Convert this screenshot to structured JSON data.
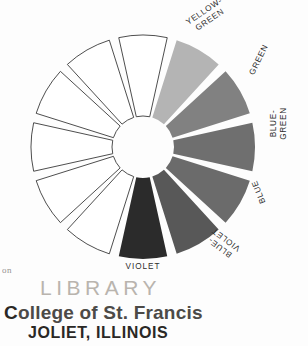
{
  "figure": {
    "center": {
      "x": 143,
      "y": 147
    },
    "outer_radius": 112,
    "inner_radius": 31,
    "segment_count": 12,
    "gap_degrees": 5
  },
  "chart_data": {
    "type": "pie",
    "xlabel": "",
    "ylabel": "",
    "categories": [
      "",
      "YELLOW-\nGREEN",
      "GREEN",
      "BLUE-\nGREEN",
      "BLUE",
      "BLUE-\nVIOLET",
      "VIOLET",
      "",
      "",
      "",
      "",
      ""
    ],
    "values": [
      1,
      1,
      1,
      1,
      1,
      1,
      1,
      1,
      1,
      1,
      1,
      1
    ],
    "legend_position": "around-rim",
    "grid": false,
    "segments": [
      {
        "index": 0,
        "label": "",
        "labeled": false,
        "fill": "#ffffff",
        "stroke": "#3a3a3a",
        "start_deg": -15,
        "end_deg": 15
      },
      {
        "index": 1,
        "label": "YELLOW-\nGREEN",
        "labeled": true,
        "fill": "#b4b4b4",
        "stroke": "none",
        "start_deg": 15,
        "end_deg": 45
      },
      {
        "index": 2,
        "label": "GREEN",
        "labeled": true,
        "fill": "#818181",
        "stroke": "none",
        "start_deg": 45,
        "end_deg": 75
      },
      {
        "index": 3,
        "label": "BLUE-\nGREEN",
        "labeled": true,
        "fill": "#6f6f6f",
        "stroke": "none",
        "start_deg": 75,
        "end_deg": 105
      },
      {
        "index": 4,
        "label": "BLUE",
        "labeled": true,
        "fill": "#6b6b6b",
        "stroke": "none",
        "start_deg": 105,
        "end_deg": 135
      },
      {
        "index": 5,
        "label": "BLUE-\nVIOLET",
        "labeled": true,
        "fill": "#585858",
        "stroke": "none",
        "start_deg": 135,
        "end_deg": 165
      },
      {
        "index": 6,
        "label": "VIOLET",
        "labeled": true,
        "fill": "#2b2b2b",
        "stroke": "none",
        "start_deg": 165,
        "end_deg": 195
      },
      {
        "index": 7,
        "label": "",
        "labeled": false,
        "fill": "#ffffff",
        "stroke": "#3a3a3a",
        "start_deg": 195,
        "end_deg": 225
      },
      {
        "index": 8,
        "label": "",
        "labeled": false,
        "fill": "#ffffff",
        "stroke": "#3a3a3a",
        "start_deg": 225,
        "end_deg": 255
      },
      {
        "index": 9,
        "label": "",
        "labeled": false,
        "fill": "#ffffff",
        "stroke": "#3a3a3a",
        "start_deg": 255,
        "end_deg": 285
      },
      {
        "index": 10,
        "label": "",
        "labeled": false,
        "fill": "#ffffff",
        "stroke": "#3a3a3a",
        "start_deg": 285,
        "end_deg": 315
      },
      {
        "index": 11,
        "label": "",
        "labeled": false,
        "fill": "#ffffff",
        "stroke": "#3a3a3a",
        "start_deg": 315,
        "end_deg": 345
      }
    ]
  },
  "labels": {
    "yellow_green": "YELLOW-\nGREEN",
    "green": "GREEN",
    "blue_green": "BLUE-\nGREEN",
    "blue": "BLUE",
    "blue_violet": "BLUE-\nVIOLET",
    "violet": "VIOLET"
  },
  "stamp": {
    "fragment": "on",
    "library": "LIBRARY",
    "college_lead": "C",
    "college_rest": "ollege of St. Francis",
    "city": "JOLIET, ILLINOIS"
  },
  "colors": {
    "yellow_green": "#b4b4b4",
    "green": "#818181",
    "blue_green": "#6f6f6f",
    "blue": "#6b6b6b",
    "blue_violet": "#585858",
    "violet": "#2b2b2b",
    "empty": "#ffffff",
    "outline": "#3a3a3a",
    "stamp_faded": "#b9b4ae",
    "stamp_dark": "#2a2825",
    "page": "#fdfdfd"
  }
}
